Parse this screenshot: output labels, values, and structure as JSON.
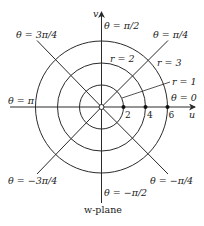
{
  "diagram": {
    "title": "w-plane",
    "colors": {
      "stroke": "#2a2a2a",
      "background": "#ffffff"
    },
    "center": {
      "x": 101.5,
      "y": 107
    },
    "scale_px_per_unit": 11,
    "axes": {
      "horizontal": {
        "label": "u",
        "x1": 10,
        "x2": 195
      },
      "vertical": {
        "label": "v",
        "y1": 12,
        "y2": 203
      }
    },
    "circles": [
      {
        "r_value": 2,
        "label": "r = 1",
        "radius_px": 22
      },
      {
        "r_value": 4,
        "label": "r = 2",
        "radius_px": 44
      },
      {
        "r_value": 6,
        "label": "r = 3",
        "radius_px": 66
      }
    ],
    "ticks": [
      {
        "value": "2",
        "x": 123.5
      },
      {
        "value": "4",
        "x": 145.5
      },
      {
        "value": "6",
        "x": 167.5
      }
    ],
    "rays": [
      {
        "angle_label": "θ = 0"
      },
      {
        "angle_label": "θ = π/4"
      },
      {
        "angle_label": "θ = π/2"
      },
      {
        "angle_label": "θ = 3π/4"
      },
      {
        "angle_label": "θ = π"
      },
      {
        "angle_label": "θ = −3π/4"
      },
      {
        "angle_label": "θ = −π/2"
      },
      {
        "angle_label": "θ = −π/4"
      }
    ],
    "origin_marker": "open-circle"
  }
}
